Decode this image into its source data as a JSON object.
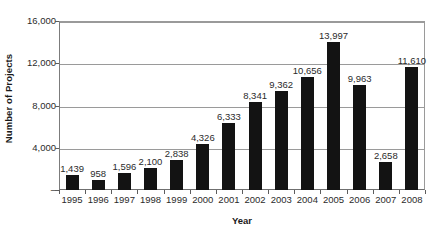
{
  "chart_data": {
    "type": "bar",
    "title": "",
    "xlabel": "Year",
    "ylabel": "Number of Projects",
    "categories": [
      "1995",
      "1996",
      "1997",
      "1998",
      "1999",
      "2000",
      "2001",
      "2002",
      "2003",
      "2004",
      "2005",
      "2006",
      "2007",
      "2008"
    ],
    "values": [
      1439,
      958,
      1596,
      2100,
      2838,
      4326,
      6333,
      8341,
      9362,
      10656,
      13997,
      9963,
      2658,
      11610
    ],
    "value_labels": [
      "1,439",
      "958",
      "1,596",
      "2,100",
      "2,838",
      "4,326",
      "6,333",
      "8,341",
      "9,362",
      "10,656",
      "13,997",
      "9,963",
      "2,658",
      "11,610"
    ],
    "ylim": [
      0,
      16000
    ],
    "ytick_values": [
      16000,
      12000,
      8000,
      4000,
      0
    ],
    "ytick_labels": [
      "16,000",
      "12,000",
      "8,000",
      "4,000",
      "–"
    ],
    "grid": true,
    "legend": "none",
    "series_color": "#131313",
    "gridline_color": "#9a9a9a",
    "axis_color": "#6f6f6f",
    "background_color": "#ffffff",
    "text_color": "#2b2b2b"
  }
}
